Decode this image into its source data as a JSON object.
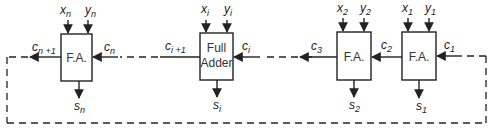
{
  "diagram": {
    "colors": {
      "line": "#222222",
      "background": "#ffffff"
    },
    "stages": [
      {
        "id": "n",
        "label": "F.A.",
        "inputs": [
          "x",
          "y"
        ],
        "input_sub": "n",
        "carry_in": "c",
        "carry_in_sub": "n",
        "carry_out": "c",
        "carry_out_sub": "n +1",
        "sum": "s",
        "sum_sub": "n"
      },
      {
        "id": "i",
        "label_line1": "Full",
        "label_line2": "Adder",
        "inputs": [
          "x",
          "y"
        ],
        "input_sub": "i",
        "carry_in": "c",
        "carry_in_sub": "i",
        "carry_out": "c",
        "carry_out_sub": "i +1",
        "sum": "s",
        "sum_sub": "i"
      },
      {
        "id": "2",
        "label": "F.A.",
        "inputs": [
          "x",
          "y"
        ],
        "input_sub": "2",
        "carry_in": "c",
        "carry_in_sub": "2",
        "carry_out": "c",
        "carry_out_sub": "3",
        "sum": "s",
        "sum_sub": "2"
      },
      {
        "id": "1",
        "label": "F.A.",
        "inputs": [
          "x",
          "y"
        ],
        "input_sub": "1",
        "carry_in": "c",
        "carry_in_sub": "1",
        "sum": "s",
        "sum_sub": "1"
      }
    ],
    "connections": [
      {
        "from": "carry-out-n",
        "to": "carry-in-1",
        "style": "dashed",
        "description": "end-around carry loop"
      },
      {
        "from": "stage-i",
        "to": "stage-n",
        "style": "dashed"
      },
      {
        "from": "stage-2",
        "to": "stage-i",
        "style": "dashed"
      }
    ]
  }
}
